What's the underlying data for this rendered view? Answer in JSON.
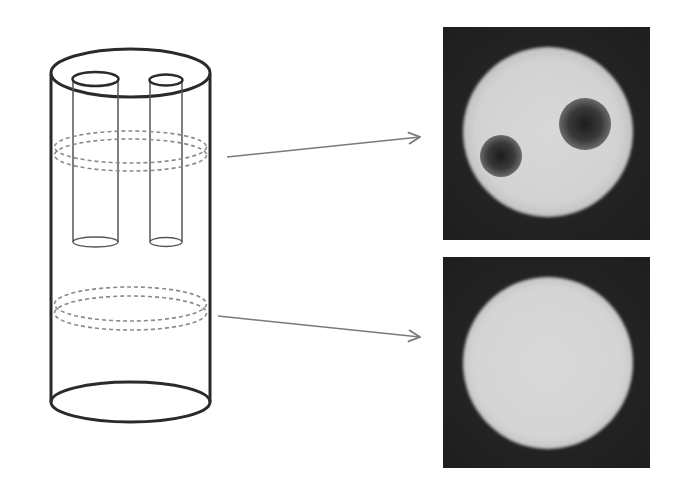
{
  "figure": {
    "colors": {
      "line": "#2a2a2a",
      "thin_line": "#555555",
      "dashed_ring": "#8a8a8a",
      "arrow": "#7a7a7a",
      "image_background": "#1f1f1f",
      "image_bright": "#d9d9d9",
      "image_dark_spot": "#2b2b2b"
    },
    "phantom": {
      "label": "cylinder-phantom",
      "inserts": [
        {
          "name": "rod-left",
          "relative_size": "larger"
        },
        {
          "name": "rod-right",
          "relative_size": "smaller"
        }
      ],
      "slices": [
        {
          "name": "upper-slice",
          "through_inserts": true
        },
        {
          "name": "lower-slice",
          "through_inserts": false
        }
      ]
    },
    "images": [
      {
        "name": "cross-section-upper",
        "content": "bright disk with two dark circular spots"
      },
      {
        "name": "cross-section-lower",
        "content": "uniform bright disk"
      }
    ]
  }
}
